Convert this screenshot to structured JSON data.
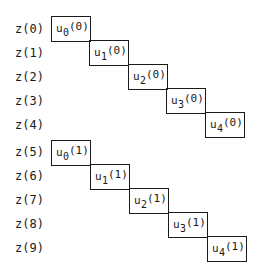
{
  "labels": [
    "z(0)",
    "z(1)",
    "z(2)",
    "z(3)",
    "z(4)",
    "z(5)",
    "z(6)",
    "z(7)",
    "z(8)",
    "z(9)"
  ],
  "groups": [
    {
      "cells": [
        {
          "var": "u",
          "sub": "0",
          "arg": "(0)"
        },
        {
          "var": "u",
          "sub": "1",
          "arg": "(0)"
        },
        {
          "var": "u",
          "sub": "2",
          "arg": "(0)"
        },
        {
          "var": "u",
          "sub": "3",
          "arg": "(0)"
        },
        {
          "var": "u",
          "sub": "4",
          "arg": "(0)"
        }
      ]
    },
    {
      "cells": [
        {
          "var": "u",
          "sub": "0",
          "arg": "(1)"
        },
        {
          "var": "u",
          "sub": "1",
          "arg": "(1)"
        },
        {
          "var": "u",
          "sub": "2",
          "arg": "(1)"
        },
        {
          "var": "u",
          "sub": "3",
          "arg": "(1)"
        },
        {
          "var": "u",
          "sub": "4",
          "arg": "(1)"
        }
      ]
    }
  ]
}
